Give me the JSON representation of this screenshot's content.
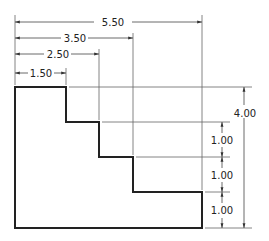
{
  "drawing": {
    "title": "Stepped profile with baseline dimensions",
    "horizontal_dims": [
      {
        "label": "5.50",
        "y": 22,
        "x_end": 202
      },
      {
        "label": "3.50",
        "y": 38,
        "x_end": 133
      },
      {
        "label": "2.50",
        "y": 54,
        "x_end": 99
      },
      {
        "label": "1.50",
        "y": 73,
        "x_end": 66
      }
    ],
    "vertical_dims": [
      {
        "label": "1.00",
        "y_top": 122,
        "y_bottom": 157
      },
      {
        "label": "1.00",
        "y_top": 157,
        "y_bottom": 192
      },
      {
        "label": "1.00",
        "y_top": 192,
        "y_bottom": 228
      }
    ],
    "overall_height": {
      "label": "4.00",
      "y_top": 87,
      "y_bottom": 228
    },
    "colors": {
      "object_line": "#222222",
      "dimension_line": "#555555"
    }
  }
}
